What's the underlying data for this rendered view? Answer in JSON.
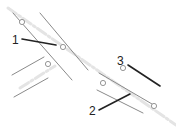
{
  "diagram": {
    "type": "technical-line-drawing",
    "colors": {
      "background": "#ffffff",
      "edge_line": "#8a8a8a",
      "leader_line": "#222222",
      "center_line": "#e4e4e4",
      "circle": "#8a8a8a",
      "label": "#222222"
    },
    "callouts": [
      {
        "number": "1",
        "text_x": 12,
        "text_y": 44,
        "leader": [
          22,
          39,
          56,
          45
        ]
      },
      {
        "number": "2",
        "text_x": 89,
        "text_y": 115,
        "leader": [
          99,
          110,
          130,
          94
        ]
      },
      {
        "number": "3",
        "text_x": 117,
        "text_y": 65,
        "leader": [
          128,
          65,
          160,
          86
        ]
      }
    ],
    "edges": [
      [
        13,
        13,
        72,
        80
      ],
      [
        40,
        13,
        88,
        70
      ],
      [
        12,
        75,
        44,
        57
      ],
      [
        14,
        97,
        48,
        78
      ],
      [
        99,
        73,
        152,
        104
      ],
      [
        97,
        90,
        143,
        113
      ]
    ],
    "center_lines": [
      [
        8,
        8,
        176,
        125
      ],
      [
        20,
        88,
        55,
        66
      ]
    ],
    "circles": [
      {
        "cx": 22,
        "cy": 22
      },
      {
        "cx": 63,
        "cy": 47
      },
      {
        "cx": 48,
        "cy": 64
      },
      {
        "cx": 103,
        "cy": 83
      },
      {
        "cx": 123,
        "cy": 68
      },
      {
        "cx": 154,
        "cy": 106
      }
    ]
  }
}
